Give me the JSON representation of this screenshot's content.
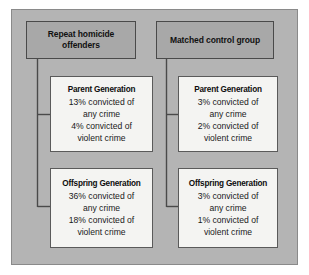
{
  "diagram": {
    "title_present": false,
    "colors": {
      "page_background": "#ffffff",
      "panel_background": "#b4b4b4",
      "panel_border": "#8a8a8a",
      "header_box_fill": "#a8a8a8",
      "header_box_border": "#4a4a4a",
      "data_box_fill": "#f4f4f2",
      "data_box_border": "#5a5a5a",
      "connector_line": "#4a4a4a",
      "text": "#111111"
    },
    "groups": [
      {
        "id": "repeat-homicide-offenders",
        "header": "Repeat homicide\noffenders",
        "header_line1": "Repeat homicide",
        "header_line2": "offenders",
        "generations": [
          {
            "id": "left-parent",
            "title": "Parent Generation",
            "line1": "13% convicted of",
            "line2": "any crime",
            "line3": "4% convicted of",
            "line4": "violent crime",
            "any_crime_pct": 13,
            "violent_crime_pct": 4
          },
          {
            "id": "left-offspring",
            "title": "Offspring Generation",
            "line1": "36% convicted of",
            "line2": "any crime",
            "line3": "18% convicted of",
            "line4": "violent crime",
            "any_crime_pct": 36,
            "violent_crime_pct": 18
          }
        ]
      },
      {
        "id": "matched-control-group",
        "header": "Matched control group",
        "header_line1": "Matched control group",
        "header_line2": "",
        "generations": [
          {
            "id": "right-parent",
            "title": "Parent Generation",
            "line1": "3% convicted of",
            "line2": "any crime",
            "line3": "2% convicted of",
            "line4": "violent crime",
            "any_crime_pct": 3,
            "violent_crime_pct": 2
          },
          {
            "id": "right-offspring",
            "title": "Offspring Generation",
            "line1": "3% convicted of",
            "line2": "any crime",
            "line3": "1% convicted of",
            "line4": "violent crime",
            "any_crime_pct": 3,
            "violent_crime_pct": 1
          }
        ]
      }
    ]
  }
}
